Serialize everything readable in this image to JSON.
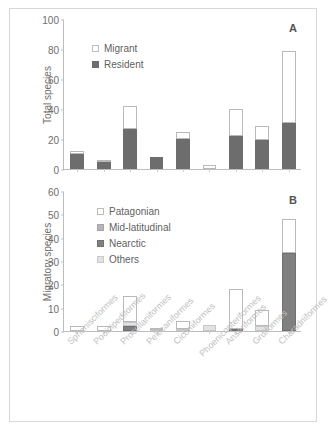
{
  "figure": {
    "background": "#ffffff",
    "frame_color": "#d8d8d8"
  },
  "chart_data": [
    {
      "type": "bar",
      "panel": "A",
      "title": "",
      "xlabel": "",
      "ylabel": "Total species",
      "ylim": [
        0,
        100
      ],
      "yticks": [
        0,
        20,
        40,
        60,
        80,
        100
      ],
      "grid": false,
      "stacked": true,
      "legend_position": "top-left",
      "categories": [
        "Sphenisciformes",
        "Podicipediformes",
        "Procellariiformes",
        "Pelecaniformes",
        "Ciconiiformes",
        "Phoenicopteriformes",
        "Anseriformes",
        "Gruiformes",
        "Charadriiformes"
      ],
      "series": [
        {
          "name": "Resident",
          "color": "#6d6d6d",
          "values": [
            10,
            4.5,
            27,
            8,
            20,
            0,
            22,
            19.5,
            31
          ]
        },
        {
          "name": "Migrant",
          "color": "#ffffff",
          "values": [
            2,
            1,
            15,
            0,
            4.5,
            3,
            18,
            9.5,
            48
          ]
        }
      ],
      "totals": [
        12,
        5.5,
        42,
        8,
        24.5,
        3,
        40,
        29,
        79
      ]
    },
    {
      "type": "bar",
      "panel": "B",
      "title": "",
      "xlabel": "",
      "ylabel": "Migratory species",
      "ylim": [
        0,
        60
      ],
      "yticks": [
        0,
        10,
        20,
        30,
        40,
        50,
        60
      ],
      "grid": false,
      "stacked": true,
      "legend_position": "top-left",
      "categories": [
        "Sphenisciformes",
        "Podicipediformes",
        "Procellariiformes",
        "Pelecaniformes",
        "Ciconiiformes",
        "Phoenicopteriformes",
        "Anseriformes",
        "Gruiformes",
        "Charadriiformes"
      ],
      "series": [
        {
          "name": "Nearctic",
          "color": "#808080",
          "values": [
            0,
            0,
            2,
            0,
            0,
            0,
            0.8,
            0,
            33.5
          ]
        },
        {
          "name": "Mid-latitudinal",
          "color": "#b5b5b5",
          "values": [
            0,
            0,
            0,
            0,
            0,
            0,
            0,
            0,
            0
          ]
        },
        {
          "name": "Others",
          "color": "#e2e2e2",
          "values": [
            0,
            0,
            2,
            0.3,
            0.8,
            2.5,
            0,
            2,
            0
          ]
        },
        {
          "name": "Patagonian",
          "color": "#ffffff",
          "values": [
            2,
            2,
            11,
            0.4,
            3.7,
            0,
            17.2,
            7,
            14.5
          ]
        }
      ],
      "totals": [
        2,
        2,
        15,
        0.7,
        4.5,
        2.5,
        18,
        9,
        48
      ]
    }
  ],
  "panel_a": {
    "letter": "A",
    "ylabel": "Migratory species placeholder",
    "axis_title": "Total species",
    "legend": [
      {
        "label": "Migrant",
        "swatch": "open-square-icon"
      },
      {
        "label": "Resident",
        "swatch": "filled-square-icon"
      }
    ],
    "ytick_labels": [
      "0",
      "20",
      "40",
      "60",
      "80",
      "100"
    ]
  },
  "panel_b": {
    "letter": "B",
    "axis_title": "Migratory species",
    "legend": [
      {
        "label": "Patagonian",
        "swatch": "open-square-icon"
      },
      {
        "label": "Mid-latitudinal",
        "swatch": "mid-gray-square-icon"
      },
      {
        "label": "Nearctic",
        "swatch": "dark-gray-square-icon"
      },
      {
        "label": "Others",
        "swatch": "light-gray-square-icon"
      }
    ],
    "ytick_labels": [
      "0",
      "10",
      "20",
      "30",
      "40",
      "50",
      "60"
    ]
  },
  "x_categories": [
    "Sphenisciformes",
    "Podicipediformes",
    "Procellariiformes",
    "Pelecaniformes",
    "Ciconiiformes",
    "Phoenicopteriformes",
    "Anseriformes",
    "Gruiformes",
    "Charadriiformes"
  ]
}
